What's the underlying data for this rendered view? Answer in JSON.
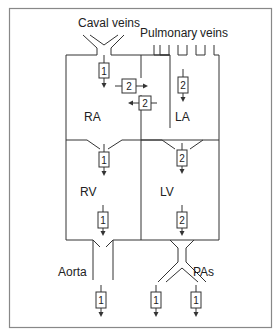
{
  "diagram": {
    "labels": {
      "caval_veins": "Caval veins",
      "pulmonary": "Pulmonary",
      "veins": "veins",
      "ra": "RA",
      "la": "LA",
      "rv": "RV",
      "lv": "LV",
      "aorta": "Aorta",
      "pas": "PAs"
    },
    "flow_markers": {
      "caval_to_ra": "1",
      "ra_to_la_shunt": "2",
      "la_to_ra_shunt": "2",
      "pulmonary_to_la": "2",
      "ra_to_rv": "1",
      "la_to_lv": "2",
      "rv_out": "1",
      "lv_out": "2",
      "aorta_out": "1",
      "pa_left_out": "1",
      "pa_right_out": "1"
    },
    "colors": {
      "line": "#333333",
      "border": "#888888",
      "background": "#ffffff"
    }
  }
}
